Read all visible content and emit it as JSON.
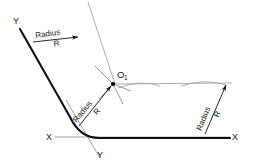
{
  "diagram": {
    "type": "engineering-drawing",
    "background_color": "#ffffff",
    "colors": {
      "object_line": "#111111",
      "construction_line": "#9a9a9a",
      "thin_line": "#7d7d7d",
      "text": "#1a1a1a",
      "center_point": "#000000"
    },
    "axes": {
      "horizontal": {
        "name": "X-X",
        "left_label": "X",
        "right_label": "X"
      },
      "inclined": {
        "name": "Y-Y",
        "top_label": "Y",
        "bottom_label": "Y"
      }
    },
    "center_point": {
      "label": "O",
      "subscript": "1"
    },
    "dimensions": [
      {
        "id": "radius-upper-left",
        "word": "Radius",
        "letter": "R",
        "rotation_deg": -38,
        "position": "upper-left along inclined leg"
      },
      {
        "id": "radius-center",
        "word": "Radius",
        "letter": "R",
        "rotation_deg": -52,
        "position": "center at fillet, pointing to O1"
      },
      {
        "id": "radius-right",
        "word": "Radius",
        "letter": "R",
        "rotation_deg": -72,
        "position": "right side, vertical offset from X-X"
      }
    ]
  }
}
